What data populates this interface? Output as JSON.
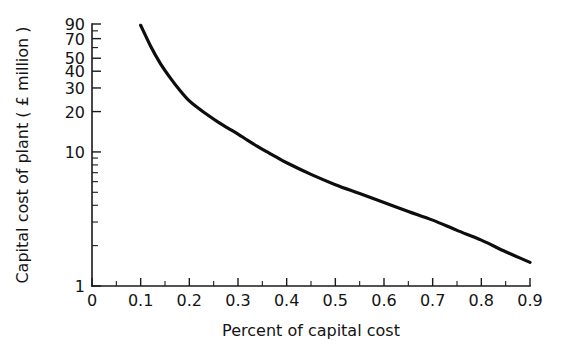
{
  "chart_data": {
    "type": "line",
    "title": "",
    "xlabel": "Percent of capital cost",
    "ylabel": "Capital cost of plant ( £ million )",
    "xlim": [
      0,
      0.9
    ],
    "ylim": [
      1,
      90
    ],
    "yscale": "log",
    "xscale": "linear",
    "grid": false,
    "legend": null,
    "x_ticks": [
      {
        "value": 0,
        "label": "0"
      },
      {
        "value": 0.1,
        "label": "0.1"
      },
      {
        "value": 0.2,
        "label": "0.2"
      },
      {
        "value": 0.3,
        "label": "0.3"
      },
      {
        "value": 0.4,
        "label": "0.4"
      },
      {
        "value": 0.5,
        "label": "0.5"
      },
      {
        "value": 0.6,
        "label": "0.6"
      },
      {
        "value": 0.7,
        "label": "0.7"
      },
      {
        "value": 0.8,
        "label": "0.8"
      },
      {
        "value": 0.9,
        "label": "0.9"
      }
    ],
    "y_ticks": [
      {
        "value": 1,
        "label": "1"
      },
      {
        "value": 10,
        "label": "10"
      },
      {
        "value": 20,
        "label": "20"
      },
      {
        "value": 30,
        "label": "30"
      },
      {
        "value": 40,
        "label": "40"
      },
      {
        "value": 50,
        "label": "50"
      },
      {
        "value": 70,
        "label": "70"
      },
      {
        "value": 90,
        "label": "90"
      }
    ],
    "y_minor_ticks": [
      2,
      3,
      4,
      5,
      6,
      7,
      8,
      9,
      60,
      80
    ],
    "series": [
      {
        "name": "Capital cost of plant",
        "x": [
          0.1,
          0.12,
          0.14,
          0.16,
          0.18,
          0.2,
          0.22,
          0.24,
          0.26,
          0.28,
          0.3,
          0.32,
          0.34,
          0.36,
          0.38,
          0.4,
          0.45,
          0.5,
          0.55,
          0.6,
          0.65,
          0.7,
          0.75,
          0.8,
          0.85,
          0.9
        ],
        "y": [
          88.0,
          62.0,
          46.0,
          36.0,
          29.0,
          24.0,
          21.0,
          18.6,
          16.6,
          15.0,
          13.6,
          12.2,
          11.0,
          10.0,
          9.1,
          8.3,
          6.8,
          5.7,
          4.9,
          4.2,
          3.6,
          3.1,
          2.6,
          2.2,
          1.8,
          1.5
        ]
      }
    ]
  },
  "axes": {
    "x_axis_title": "Percent of capital cost",
    "y_axis_title": "Capital cost of plant ( £ million )"
  }
}
